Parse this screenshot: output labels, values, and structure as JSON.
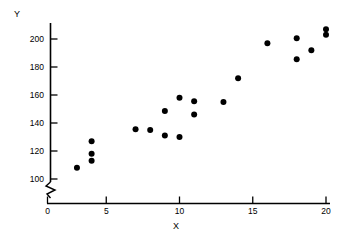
{
  "chart_data": {
    "type": "scatter",
    "title": "",
    "xlabel": "X",
    "ylabel": "Y",
    "xlim": [
      0,
      20
    ],
    "ylim": [
      100,
      208
    ],
    "y_axis_break": true,
    "y_axis_break_note": "zigzag break between 0 and 100",
    "grid": false,
    "legend": null,
    "xticks": [
      0,
      5,
      10,
      15,
      20
    ],
    "yticks": [
      100,
      120,
      140,
      160,
      180,
      200
    ],
    "xtick_labels": [
      "0",
      "5",
      "10",
      "15",
      "20"
    ],
    "ytick_labels": [
      "100",
      "120",
      "140",
      "160",
      "180",
      "200"
    ],
    "marker": {
      "shape": "circle",
      "color": "#000000",
      "size_px": 6
    },
    "n_points": 22,
    "x": [
      3,
      4,
      4,
      4,
      7,
      8,
      9,
      9,
      10,
      10,
      11,
      11,
      13,
      14,
      16,
      18,
      18,
      19,
      20,
      20
    ],
    "y": [
      108,
      127,
      118,
      113,
      135.5,
      135,
      131,
      148.5,
      158,
      130,
      155.5,
      146,
      155,
      172,
      197,
      200.5,
      185.5,
      192,
      207,
      203
    ],
    "points": [
      {
        "x": 3,
        "y": 108
      },
      {
        "x": 4,
        "y": 127
      },
      {
        "x": 4,
        "y": 118
      },
      {
        "x": 4,
        "y": 113
      },
      {
        "x": 7,
        "y": 135.5
      },
      {
        "x": 8,
        "y": 135
      },
      {
        "x": 9,
        "y": 131
      },
      {
        "x": 9,
        "y": 148.5
      },
      {
        "x": 10,
        "y": 158
      },
      {
        "x": 10,
        "y": 130
      },
      {
        "x": 11,
        "y": 155.5
      },
      {
        "x": 11,
        "y": 146
      },
      {
        "x": 13,
        "y": 155
      },
      {
        "x": 14,
        "y": 172
      },
      {
        "x": 16,
        "y": 197
      },
      {
        "x": 18,
        "y": 200.5
      },
      {
        "x": 18,
        "y": 185.5
      },
      {
        "x": 19,
        "y": 192
      },
      {
        "x": 20,
        "y": 207
      },
      {
        "x": 20,
        "y": 203
      }
    ]
  },
  "axes": {
    "y_title": "Y",
    "x_title": "X",
    "axis_color": "#000000"
  }
}
